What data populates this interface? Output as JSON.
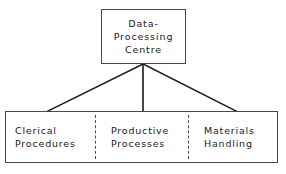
{
  "diagram": {
    "type": "organisation-tree",
    "background_color": "#ffffff",
    "line_color": "#1a1a1a",
    "border_color": "#4a4a4a",
    "top_node": {
      "id": "data-processing-centre",
      "lines": [
        "Data-",
        "Processing",
        "Centre"
      ],
      "text": "Data-Processing Centre"
    },
    "children": [
      {
        "id": "clerical-procedures",
        "lines": [
          "Clerical",
          "Procedures"
        ],
        "text": "Clerical Procedures"
      },
      {
        "id": "productive-processes",
        "lines": [
          "Productive",
          "Processes"
        ],
        "text": "Productive Processes"
      },
      {
        "id": "materials-handling",
        "lines": [
          "Materials",
          "Handling"
        ],
        "text": "Materials Handling"
      }
    ],
    "connectors": [
      {
        "id": "connector-left",
        "from": [
          143,
          64
        ],
        "to": [
          48,
          111
        ],
        "style": "solid"
      },
      {
        "id": "connector-centre",
        "from": [
          143,
          64
        ],
        "to": [
          143,
          111
        ],
        "style": "solid"
      },
      {
        "id": "connector-right",
        "from": [
          143,
          64
        ],
        "to": [
          236,
          111
        ],
        "style": "solid"
      }
    ],
    "dividers": [
      {
        "id": "divider-1",
        "x": 95,
        "style": "dashed"
      },
      {
        "id": "divider-2",
        "x": 188,
        "style": "dashed"
      }
    ]
  }
}
